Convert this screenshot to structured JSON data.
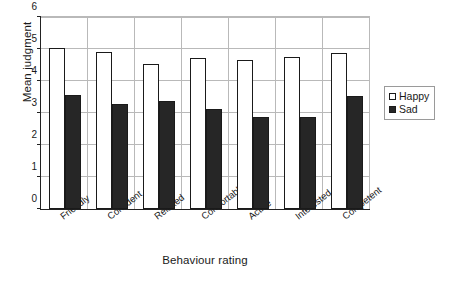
{
  "chart_data": {
    "type": "bar",
    "title": "",
    "xlabel": "Behaviour rating",
    "ylabel": "Mean judgment",
    "categories": [
      "Friendly",
      "Confident",
      "Relaxed",
      "Comfortable",
      "Active",
      "Interested",
      "Competent"
    ],
    "series": [
      {
        "name": "Happy",
        "color": "#ffffff",
        "values": [
          5.0,
          4.87,
          4.5,
          4.7,
          4.62,
          4.72,
          4.85
        ]
      },
      {
        "name": "Sad",
        "color": "#262626",
        "values": [
          3.55,
          3.27,
          3.35,
          3.1,
          2.87,
          2.85,
          3.52
        ]
      }
    ],
    "ylim": [
      0,
      6
    ],
    "yticks": [
      0,
      1,
      2,
      3,
      4,
      5,
      6
    ],
    "ytick_labels": [
      "0",
      "1",
      "2",
      "3",
      "4",
      "5",
      "6"
    ],
    "grid": "horizontal",
    "legend_position": "right",
    "legend_entries": [
      "Happy",
      "Sad"
    ]
  }
}
